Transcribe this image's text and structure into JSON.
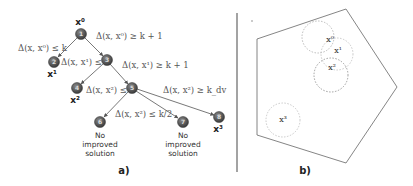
{
  "panel_a": {
    "label": "a)",
    "nodes": [
      {
        "id": "1",
        "x": 81,
        "y": 34,
        "tag": "x",
        "sup": "0"
      },
      {
        "id": "2",
        "x": 54,
        "y": 62,
        "tag": "x",
        "sup": "1"
      },
      {
        "id": "3",
        "x": 107,
        "y": 60
      },
      {
        "id": "4",
        "x": 77,
        "y": 88,
        "tag": "x",
        "sup": "2"
      },
      {
        "id": "5",
        "x": 132,
        "y": 88
      },
      {
        "id": "6",
        "x": 100,
        "y": 122,
        "note": "No improved solution"
      },
      {
        "id": "7",
        "x": 183,
        "y": 122,
        "note": "No improved solution"
      },
      {
        "id": "8",
        "x": 219,
        "y": 117,
        "tag": "x",
        "sup": "3"
      }
    ],
    "edges": [
      {
        "from": "1",
        "to": "2",
        "label": "Δ(x, x⁰) ≤ k"
      },
      {
        "from": "1",
        "to": "3",
        "label": "Δ(x, x⁰) ≥ k + 1"
      },
      {
        "from": "3",
        "to": "4",
        "label": "Δ(x, x¹) ≤ k"
      },
      {
        "from": "3",
        "to": "5",
        "label": "Δ(x, x¹) ≥ k + 1"
      },
      {
        "from": "5",
        "to": "6",
        "label": "Δ(x, x²) ≤ k"
      },
      {
        "from": "5",
        "to": "7",
        "label": "Δ(x, x²) ≤ k/2"
      },
      {
        "from": "5",
        "to": "8",
        "label": "Δ(x, x²) ≥ k_dv"
      }
    ],
    "labels": {
      "e12": "Δ(x, x⁰) ≤ k",
      "e13": "Δ(x, x⁰) ≥ k + 1",
      "e34": "Δ(x, x¹) ≤ k",
      "e35": "Δ(x, x¹) ≥ k + 1",
      "e56": "Δ(x, x²) ≤ k",
      "e57": "Δ(x, x²) ≤ k/2",
      "e58": "Δ(x, x²) ≥ k_dv",
      "x0": "x⁰",
      "x1": "x¹",
      "x2": "x²",
      "x3": "x³",
      "no": "No",
      "improved": "improved",
      "solution": "solution",
      "n1": "1",
      "n2": "2",
      "n3": "3",
      "n4": "4",
      "n5": "5",
      "n6": "6",
      "n7": "7",
      "n8": "8"
    }
  },
  "panel_b": {
    "label": "b)",
    "shape": "pentagon",
    "neighborhoods": [
      {
        "name": "x⁰",
        "cx": 318,
        "cy": 37,
        "r": 16
      },
      {
        "name": "x¹",
        "cx": 337,
        "cy": 54,
        "r": 16
      },
      {
        "name": "x²",
        "cx": 331,
        "cy": 75,
        "r": 17
      },
      {
        "name": "x³",
        "cx": 283,
        "cy": 120,
        "r": 17
      }
    ],
    "labels": {
      "x0": "x⁰",
      "x1": "x¹",
      "x2": "x²",
      "x3": "x³"
    }
  },
  "colors": {
    "node_fill": "#555555",
    "edge": "#555555",
    "circle_dash": "#aaaaaa",
    "pentagon": "#666666",
    "divider": "#666666"
  }
}
